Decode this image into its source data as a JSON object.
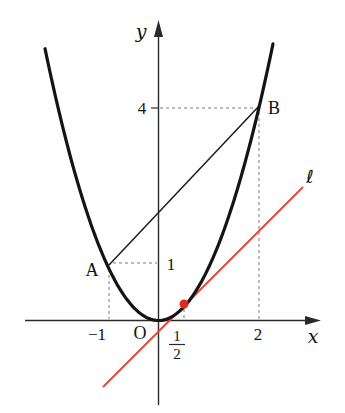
{
  "figure": {
    "type": "math-graph",
    "background": "#ffffff",
    "colors": {
      "curve": "#141414",
      "axis": "#2a2a2a",
      "secant": "#1c1c1c",
      "dashed": "#7a7a7a",
      "red_line": "#e04a3c",
      "red_dot": "#e02a1e"
    }
  },
  "labels": {
    "y_axis": "y",
    "x_axis": "x",
    "origin": "O",
    "ell": "ℓ",
    "point_a": "A",
    "point_b": "B",
    "tick_minus1": "−1",
    "tick_2": "2",
    "tick_1": "1",
    "tick_4": "4",
    "frac_num": "1",
    "frac_den": "2"
  },
  "math": {
    "curve": "y = x^2",
    "point_A": [
      -1,
      1
    ],
    "point_B": [
      2,
      4
    ],
    "tangent_point": [
      0.5,
      0.25
    ],
    "secant_slope": 1,
    "red_line": "line l through (1/2, 1/4) parallel to AB"
  },
  "geometry": {
    "origin_px": {
      "x": 158.5,
      "y": 320.5
    },
    "x_scale": 50,
    "y_scale": 52.75,
    "x_axis": {
      "x1": 25,
      "y1": 320.5,
      "x2": 316,
      "y2": 320.5
    },
    "y_axis": {
      "x1": 158.5,
      "y1": 405,
      "x2": 158.5,
      "y2": 25
    },
    "x_arrow": "321,320.5 305,316 305,325",
    "y_arrow": "158.5,20 154,37 163,37",
    "parabola": {
      "px_min": 45,
      "px_max": 273,
      "stroke_w": 3.2
    },
    "secant": {
      "x1": 109,
      "y1": 265,
      "x2": 260,
      "y2": 105
    },
    "red_line": {
      "x1": 103,
      "y1": 387,
      "x2": 303,
      "y2": 187
    },
    "red_dot": {
      "cx": 184,
      "cy": 304,
      "r": 4.5
    },
    "tick4": {
      "x1": 151,
      "y1": 108,
      "x2": 158.5,
      "y2": 108
    },
    "frac_bar": {
      "x1": 169,
      "y1": 344.5,
      "x2": 185,
      "y2": 344.5
    },
    "dashes": [
      [
        109,
        269,
        109,
        319
      ],
      [
        113,
        263,
        157,
        263
      ],
      [
        160,
        108,
        255,
        108
      ],
      [
        259,
        112,
        259,
        319
      ],
      [
        184,
        309,
        184,
        319
      ]
    ]
  },
  "label_pos": {
    "y_axis": {
      "x": 141,
      "y": 38
    },
    "x_axis": {
      "x": 313,
      "y": 343
    },
    "origin": {
      "x": 140,
      "y": 339
    },
    "ell": {
      "x": 310,
      "y": 183
    },
    "point_a": {
      "x": 92,
      "y": 276
    },
    "point_b": {
      "x": 274,
      "y": 114
    },
    "tick_minus1": {
      "x": 97,
      "y": 340
    },
    "tick_2": {
      "x": 258,
      "y": 340
    },
    "tick_1": {
      "x": 171,
      "y": 270
    },
    "tick_4": {
      "x": 142,
      "y": 114
    },
    "frac_num": {
      "x": 177,
      "y": 341
    },
    "frac_den": {
      "x": 177,
      "y": 359
    }
  }
}
